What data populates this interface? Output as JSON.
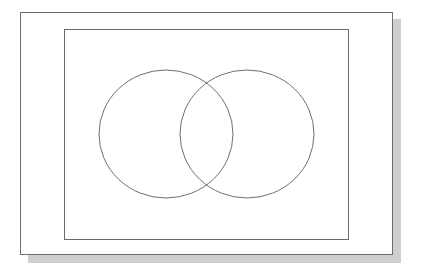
{
  "diagram": {
    "type": "venn",
    "sets": [
      {
        "name": "set-a",
        "label": ""
      },
      {
        "name": "set-b",
        "label": ""
      }
    ],
    "universal_set_label": "",
    "colors": {
      "background": "#ffffff",
      "paper": "#ffffff",
      "paper_border": "#6e6e6e",
      "shadow": "#cfcfcf",
      "rectangle_stroke": "#6a6a6a",
      "circle_stroke": "#707070"
    }
  }
}
